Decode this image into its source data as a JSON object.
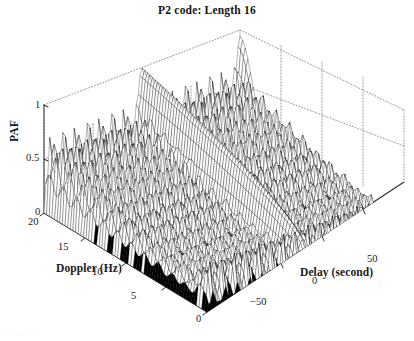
{
  "chart_data": {
    "type": "surface",
    "title": "P2 code: Length 16",
    "xlabel": "Doppler (Hz)",
    "ylabel": "Delay (second)",
    "zlabel": "PAF",
    "xlim": [
      0,
      20
    ],
    "ylim": [
      -80,
      80
    ],
    "zlim": [
      0,
      1
    ],
    "xticks": [
      "20",
      "15",
      "10",
      "5",
      "0"
    ],
    "xtick_values": [
      20,
      15,
      10,
      5,
      0
    ],
    "yticks": [
      "−50",
      "0",
      "50"
    ],
    "ytick_values": [
      -50,
      0,
      50
    ],
    "zticks": [
      "1",
      "0.5",
      "0"
    ],
    "ztick_values": [
      1,
      0.5,
      0
    ],
    "grid": true,
    "grid_style": "dotted",
    "legend": "none",
    "render_style": "mesh-wireframe",
    "mesh_color": "#000000",
    "face_color": "#ffffff",
    "surface": {
      "code_length": 16,
      "delay_periods": 16,
      "doppler_ridge_count": 20,
      "peak_paf": 1.0,
      "ridge_peak_typical": 0.62,
      "floor_level": 0.0
    }
  },
  "chart": {
    "title": "P2 code: Length 16",
    "z_axis": {
      "label": "PAF",
      "ticks": [
        "1",
        "0.5",
        "0"
      ]
    },
    "x_axis": {
      "label": "Doppler (Hz)",
      "ticks": [
        "20",
        "15",
        "10",
        "5",
        "0"
      ]
    },
    "y_axis": {
      "label": "Delay (second)",
      "ticks": [
        "−50",
        "0",
        "50"
      ]
    },
    "bottom_artifact": "· ·· ···· ·· ·  ···"
  },
  "colors": {
    "ink": "#1b1b1b",
    "mesh": "#000000",
    "grid": "#8c8c8c",
    "background": "#ffffff"
  }
}
